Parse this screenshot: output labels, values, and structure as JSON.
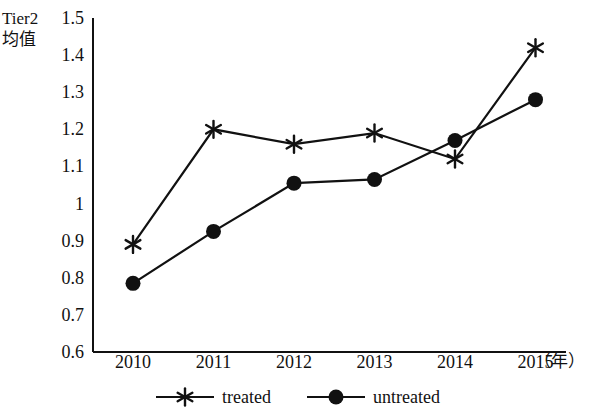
{
  "chart_data": {
    "type": "line",
    "title": "",
    "ylabel": "Tier2 均值",
    "ylabel_line1": "Tier2",
    "ylabel_line2": "均值",
    "xlabel": "（年）",
    "categories": [
      "2010",
      "2011",
      "2012",
      "2013",
      "2014",
      "2015"
    ],
    "x": [
      2010,
      2011,
      2012,
      2013,
      2014,
      2015
    ],
    "ylim": [
      0.6,
      1.5
    ],
    "yticks": [
      "1.5",
      "1.4",
      "1.3",
      "1.2",
      "1.1",
      "1",
      "0.9",
      "0.8",
      "0.7",
      "0.6"
    ],
    "ytick_values": [
      1.5,
      1.4,
      1.3,
      1.2,
      1.1,
      1.0,
      0.9,
      0.8,
      0.7,
      0.6
    ],
    "grid": false,
    "legend_position": "bottom-center",
    "series": [
      {
        "name": "treated",
        "marker": "asterisk",
        "color": "#111111",
        "values": [
          0.89,
          1.2,
          1.16,
          1.19,
          1.12,
          1.42
        ]
      },
      {
        "name": "untreated",
        "marker": "filled-circle",
        "color": "#111111",
        "values": [
          0.785,
          0.925,
          1.055,
          1.065,
          1.17,
          1.28
        ]
      }
    ]
  },
  "legend": {
    "items": [
      {
        "label": "treated",
        "marker": "asterisk"
      },
      {
        "label": "untreated",
        "marker": "filled-circle"
      }
    ]
  },
  "colors": {
    "ink": "#111111",
    "background": "#ffffff"
  }
}
